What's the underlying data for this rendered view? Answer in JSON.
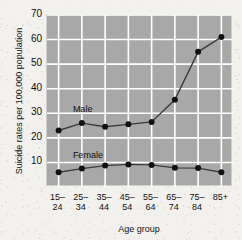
{
  "chart_data": {
    "type": "line",
    "title": "",
    "xlabel": "Age group",
    "ylabel": "Suicide rates per 100,000 population",
    "categories": [
      "15–\n24",
      "25–\n34",
      "35–\n44",
      "45–\n54",
      "55–\n64",
      "65–\n74",
      "75–\n84",
      "85+"
    ],
    "ylim": [
      0,
      70
    ],
    "yticks": [
      10,
      20,
      30,
      40,
      50,
      60,
      70
    ],
    "ytick_labels": [
      "10",
      "20",
      "30",
      "40",
      "50",
      "60",
      "70"
    ],
    "grid": true,
    "legend": "inline-labels",
    "plot_background": "#a8a8a8",
    "gridline_color": "#ffffff",
    "line_color": "#3c3c3c",
    "marker_color": "#111111",
    "series": [
      {
        "name": "Male",
        "label": "Male",
        "label_x_category": "25–34",
        "values": [
          23,
          26,
          24.5,
          25.5,
          26.5,
          35.5,
          55,
          61
        ]
      },
      {
        "name": "Female",
        "label": "Female",
        "label_x_category": "25–34",
        "values": [
          6,
          7.5,
          8.7,
          9.2,
          9.0,
          7.8,
          7.7,
          6
        ]
      }
    ]
  }
}
